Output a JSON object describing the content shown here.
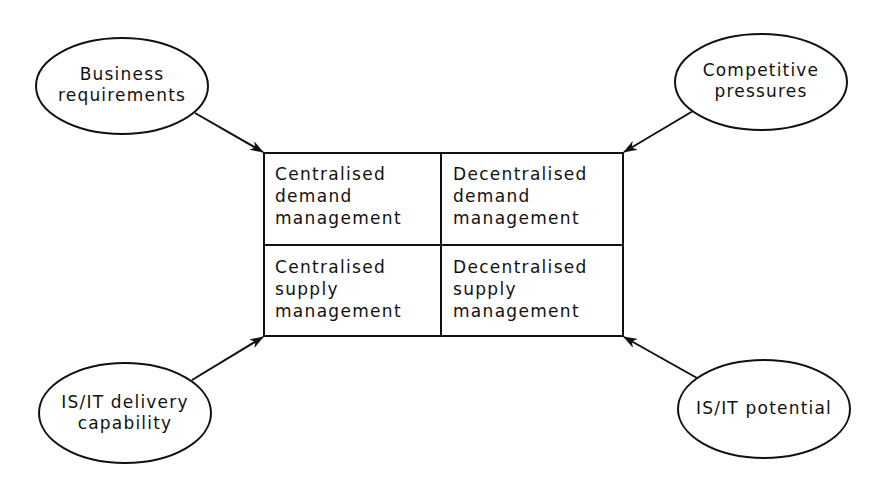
{
  "diagram": {
    "type": "influence-diagram",
    "grid": {
      "cells": [
        {
          "id": "centralised-demand",
          "lines": [
            "Centralised",
            "demand",
            "management"
          ]
        },
        {
          "id": "decentralised-demand",
          "lines": [
            "Decentralised",
            "demand",
            "management"
          ]
        },
        {
          "id": "centralised-supply",
          "lines": [
            "Centralised",
            "supply",
            "management"
          ]
        },
        {
          "id": "decentralised-supply",
          "lines": [
            "Decentralised",
            "supply",
            "management"
          ]
        }
      ]
    },
    "drivers": [
      {
        "id": "business-requirements",
        "lines": [
          "Business",
          "requirements"
        ],
        "position": "top-left"
      },
      {
        "id": "competitive-pressures",
        "lines": [
          "Competitive",
          "pressures"
        ],
        "position": "top-right"
      },
      {
        "id": "isit-delivery-capability",
        "lines": [
          "IS/IT delivery",
          "capability"
        ],
        "position": "bottom-left"
      },
      {
        "id": "isit-potential",
        "lines": [
          "IS/IT potential"
        ],
        "position": "bottom-right"
      }
    ],
    "edges": [
      {
        "from": "business-requirements",
        "to": "grid-top-left-corner"
      },
      {
        "from": "competitive-pressures",
        "to": "grid-top-right-corner"
      },
      {
        "from": "isit-delivery-capability",
        "to": "grid-bottom-left-corner"
      },
      {
        "from": "isit-potential",
        "to": "grid-bottom-right-corner"
      }
    ],
    "colors": {
      "stroke": "#111111",
      "background": "#ffffff"
    }
  }
}
